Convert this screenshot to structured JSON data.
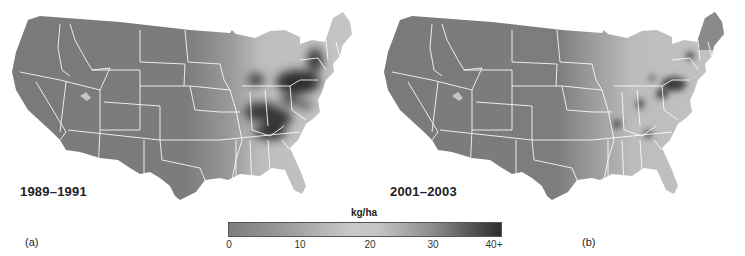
{
  "figure": {
    "panels": [
      {
        "letter": "(a)",
        "period": "1989–1991"
      },
      {
        "letter": "(b)",
        "period": "2001–2003"
      }
    ],
    "legend": {
      "unit": "kg/ha",
      "ticks": [
        "0",
        "10",
        "20",
        "30",
        "40+"
      ],
      "colors": {
        "low": "#7d7d7d",
        "mid": "#c9c9c9",
        "high": "#2e2e2e"
      }
    },
    "map_colors": {
      "base_gray": "#7a7a7a",
      "state_lines": "#ffffff",
      "light_region": "#c2c2c2",
      "hotspot": "#3a3a3a"
    }
  }
}
